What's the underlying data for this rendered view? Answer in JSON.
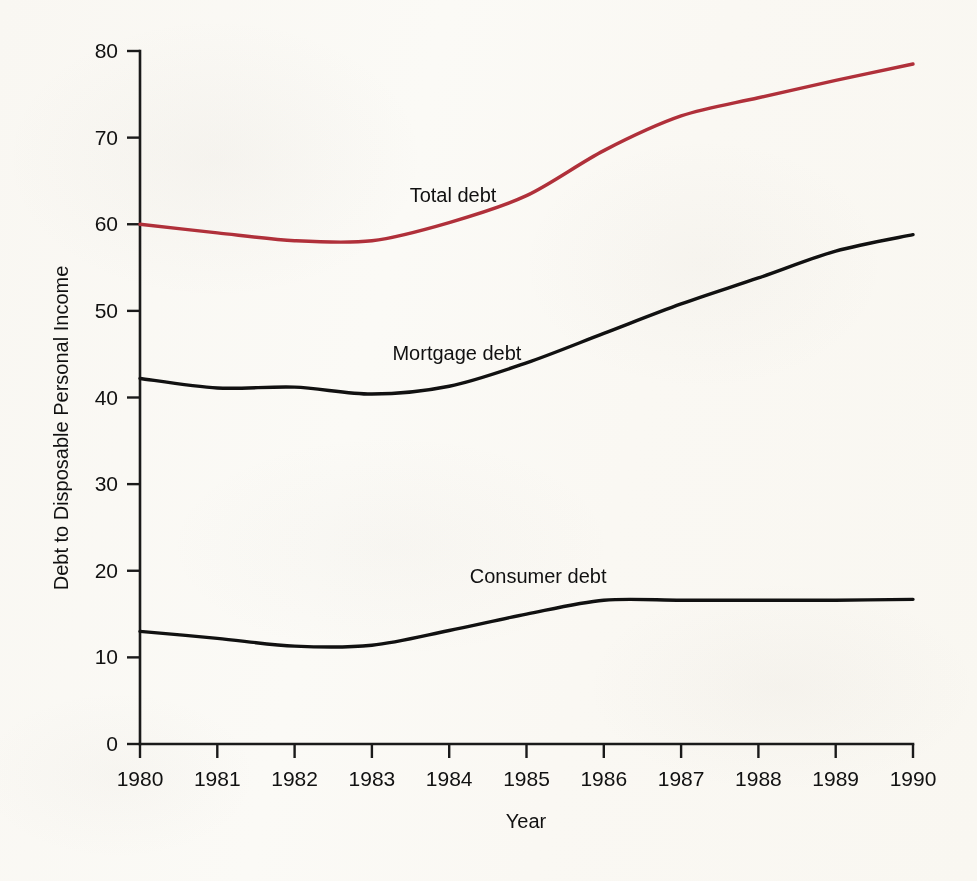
{
  "figure": {
    "background_color": "#fdfcfa",
    "axis_color": "#1a1a1a"
  },
  "chart_data": {
    "type": "line",
    "title": "",
    "xlabel": "Year",
    "ylabel": "Debt to Disposable Personal Income",
    "xlim": [
      1980,
      1990
    ],
    "ylim": [
      0,
      80
    ],
    "grid": false,
    "legend_position": "inline-labels",
    "x": [
      1980,
      1981,
      1982,
      1983,
      1984,
      1985,
      1986,
      1987,
      1988,
      1989,
      1990
    ],
    "xticklabels": [
      "1980",
      "1981",
      "1982",
      "1983",
      "1984",
      "1985",
      "1986",
      "1987",
      "1988",
      "1989",
      "1990"
    ],
    "yticks": [
      0,
      10,
      20,
      30,
      40,
      50,
      60,
      70,
      80
    ],
    "yticklabels": [
      "0",
      "10",
      "20",
      "30",
      "40",
      "50",
      "60",
      "70",
      "80"
    ],
    "series": [
      {
        "name": "Total debt",
        "label": "Total debt",
        "color": "#b0303a",
        "linewidth": 3.4,
        "values": [
          60.0,
          59.0,
          58.1,
          58.1,
          60.2,
          63.3,
          68.5,
          72.5,
          74.6,
          76.6,
          78.5
        ],
        "label_x": 1984.05,
        "label_y": 62.6
      },
      {
        "name": "Mortgage debt",
        "label": "Mortgage debt",
        "color": "#111111",
        "linewidth": 3.4,
        "values": [
          42.2,
          41.1,
          41.2,
          40.4,
          41.3,
          44.0,
          47.4,
          50.8,
          53.8,
          56.9,
          58.8
        ],
        "label_x": 1984.1,
        "label_y": 44.3
      },
      {
        "name": "Consumer debt",
        "label": "Consumer debt",
        "color": "#111111",
        "linewidth": 3.4,
        "values": [
          13.0,
          12.2,
          11.3,
          11.4,
          13.1,
          15.0,
          16.6,
          16.6,
          16.6,
          16.6,
          16.7
        ],
        "label_x": 1985.15,
        "label_y": 18.6
      }
    ]
  }
}
